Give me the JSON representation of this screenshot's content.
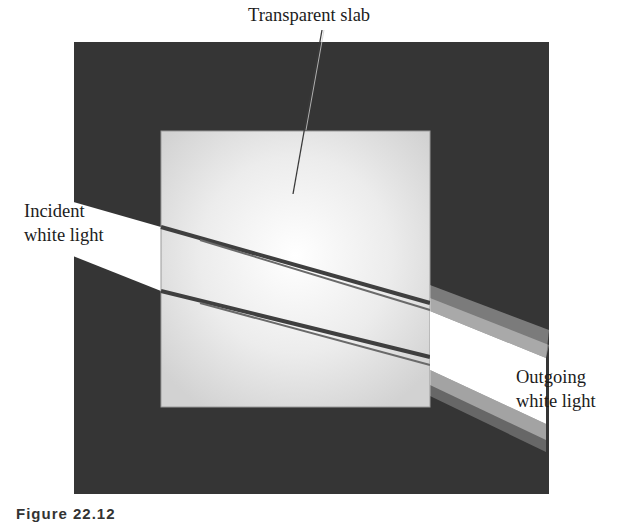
{
  "figure": {
    "title_label": "Transparent slab",
    "incident_label": {
      "line1": "Incident",
      "line2": "white light"
    },
    "outgoing_label": {
      "line1": "Outgoing",
      "line2": "white light"
    },
    "caption": "Figure 22.12",
    "colors": {
      "background": "#ffffff",
      "dark_box": "#353535",
      "slab": "#dcdcdc",
      "slab_highlight": "#ffffff",
      "beam": "#ffffff",
      "leader_line": "#3a3a3a",
      "ray_edge": "#4a4a4a"
    }
  }
}
